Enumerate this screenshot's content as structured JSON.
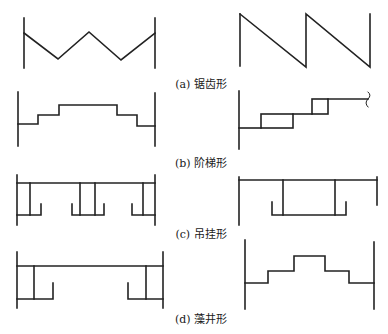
{
  "figure": {
    "panels": [
      {
        "id": "a",
        "caption": "(a) 锯齿形",
        "left_shape": "symmetric-zigzag",
        "right_shape": "sawtooth"
      },
      {
        "id": "b",
        "caption": "(b) 阶梯形",
        "left_shape": "symmetric-stepped",
        "right_shape": "ascending-stepped-with-boxes"
      },
      {
        "id": "c",
        "caption": "(c) 吊挂形",
        "left_shape": "multi-hanger-ceiling",
        "right_shape": "central-hanger-ceiling"
      },
      {
        "id": "d",
        "caption": "(d) 藻井形",
        "left_shape": "side-hanger-ceiling",
        "right_shape": "coffered-stepped"
      }
    ]
  }
}
